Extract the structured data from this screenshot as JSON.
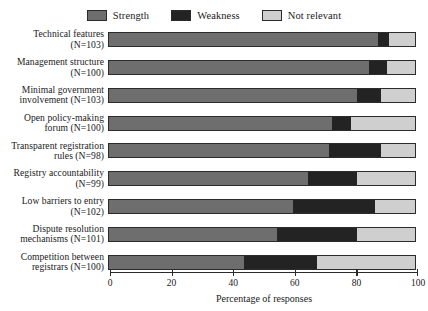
{
  "chart_data": {
    "type": "bar",
    "orientation": "horizontal",
    "stacked": true,
    "normalized_percent": true,
    "title": "",
    "subtitle": "",
    "xlabel": "Percentage of responses",
    "ylabel": "",
    "xlim": [
      0,
      100
    ],
    "xticks": [
      0,
      20,
      40,
      60,
      80,
      100
    ],
    "xtick_labels": [
      "0",
      "20",
      "40",
      "60",
      "80",
      "100"
    ],
    "grid": false,
    "legend_position": "top-center",
    "categories": [
      "Technical features\n(N=103)",
      "Management structure\n(N=100)",
      "Minimal government\ninvolvement (N=103)",
      "Open policy-making\nforum (N=100)",
      "Transparent registration\nrules (N=98)",
      "Registry accountability\n(N=99)",
      "Low barriers to entry\n(N=102)",
      "Dispute resolution\nmechanisms (N=101)",
      "Competition between\nregistrars (N=100)"
    ],
    "series": [
      {
        "name": "Strength",
        "color": "#6e6e6e",
        "values": [
          88,
          85,
          81,
          73,
          72,
          65,
          60,
          55,
          44
        ]
      },
      {
        "name": "Weakness",
        "color": "#232323",
        "values": [
          3.5,
          6,
          8,
          6,
          17,
          16,
          27,
          26,
          24
        ]
      },
      {
        "name": "Not relevant",
        "color": "#cfcfcf",
        "values": [
          8.5,
          9,
          11,
          21,
          11,
          19,
          13,
          19,
          32
        ]
      }
    ]
  },
  "legend": {
    "items": [
      {
        "label": "Strength",
        "color": "#6e6e6e"
      },
      {
        "label": "Weakness",
        "color": "#232323"
      },
      {
        "label": "Not relevant",
        "color": "#cfcfcf"
      }
    ]
  }
}
